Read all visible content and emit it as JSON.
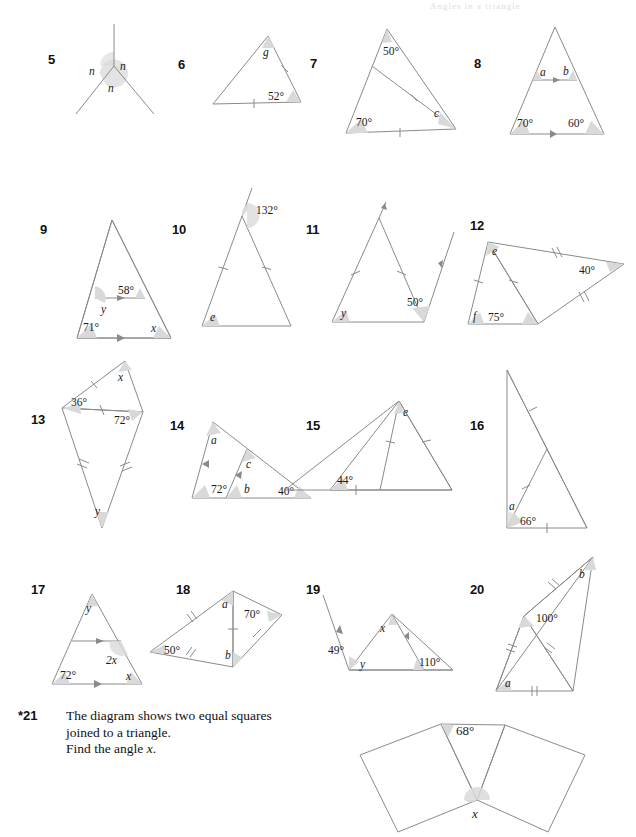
{
  "page": {
    "header_faint": "Angles in a triangle",
    "stroke": "#8a8a8a",
    "fill": "#d9d9d9",
    "text_color": "#1a1a1a"
  },
  "question21": {
    "number": "*21",
    "line1": "The diagram shows two equal squares",
    "line2": "joined to a triangle.",
    "line3_pre": "Find the angle ",
    "line3_var": "x",
    "line3_post": "."
  },
  "problems": [
    {
      "number": "5",
      "description": "three rays meeting at a point with three angles n",
      "labels": [
        "n",
        "n",
        "n"
      ]
    },
    {
      "number": "6",
      "description": "isosceles triangle with tick marks on right side and base",
      "labels": [
        "g",
        "52°"
      ]
    },
    {
      "number": "7",
      "description": "triangle with cevian, tick marks on cevian and base",
      "labels": [
        "50°",
        "70°",
        "c"
      ]
    },
    {
      "number": "8",
      "description": "triangle with a line parallel to the base",
      "labels": [
        "a",
        "b",
        "70°",
        "60°"
      ]
    },
    {
      "number": "9",
      "description": "triangle with a parallel line inside",
      "labels": [
        "58°",
        "y",
        "71°",
        "x"
      ]
    },
    {
      "number": "10",
      "description": "isosceles triangle with apex exterior angle, equal sides",
      "labels": [
        "132°",
        "e"
      ]
    },
    {
      "number": "11",
      "description": "isosceles triangle with two parallel rays",
      "labels": [
        "y",
        "50°"
      ]
    },
    {
      "number": "12",
      "description": "two joined triangles with equal-side marks",
      "labels": [
        "e",
        "40°",
        "f",
        "75°"
      ]
    },
    {
      "number": "13",
      "description": "kite shape split into two isosceles triangles",
      "labels": [
        "x",
        "36°",
        "72°",
        "y"
      ]
    },
    {
      "number": "14",
      "description": "triangle with a line parallel to the left side",
      "labels": [
        "a",
        "c",
        "72°",
        "b",
        "40°"
      ]
    },
    {
      "number": "15",
      "description": "triangle with isosceles sub-triangle",
      "labels": [
        "e",
        "44°"
      ]
    },
    {
      "number": "16",
      "description": "right triangle with internal cevian, equal segments",
      "labels": [
        "a",
        "66°"
      ]
    },
    {
      "number": "17",
      "description": "triangle with line parallel to base",
      "labels": [
        "y",
        "2x",
        "72°",
        "x"
      ]
    },
    {
      "number": "18",
      "description": "quadrilateral split by a diagonal into two isosceles triangles",
      "labels": [
        "a",
        "50°",
        "70°",
        "b"
      ]
    },
    {
      "number": "19",
      "description": "triangle with parallel arrows and exterior angle",
      "labels": [
        "x",
        "49°",
        "y",
        "110°"
      ]
    },
    {
      "number": "20",
      "description": "two joined isosceles triangles",
      "labels": [
        "b",
        "100°",
        "a"
      ]
    }
  ],
  "figure21": {
    "top_angle": "68°",
    "bottom_angle": "x"
  }
}
